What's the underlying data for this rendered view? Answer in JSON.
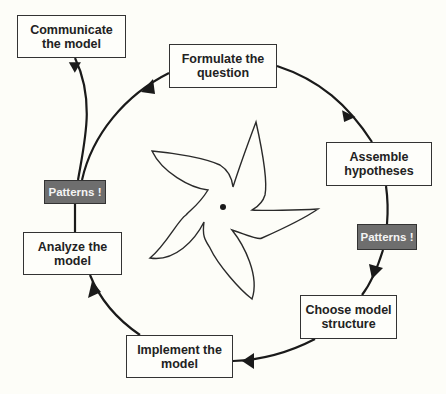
{
  "diagram": {
    "type": "cycle",
    "colors": {
      "background": "#fdfdf8",
      "stroke": "#222222",
      "pattern_fill": "#6e6e6e",
      "pattern_text": "#f4f4f4"
    },
    "steps": [
      {
        "id": "formulate",
        "line1": "Formulate the",
        "line2": "question"
      },
      {
        "id": "assemble",
        "line1": "Assemble",
        "line2": "hypotheses"
      },
      {
        "id": "choose",
        "line1": "Choose model",
        "line2": "structure"
      },
      {
        "id": "implement",
        "line1": "Implement the",
        "line2": "model"
      },
      {
        "id": "analyze",
        "line1": "Analyze the",
        "line2": "model"
      },
      {
        "id": "communicate",
        "line1": "Communicate",
        "line2": "the model"
      }
    ],
    "pattern_labels": [
      {
        "position": "right",
        "label": "Patterns !"
      },
      {
        "position": "left",
        "label": "Patterns !"
      }
    ],
    "center_icon": "five-armed-starfish-outline"
  }
}
